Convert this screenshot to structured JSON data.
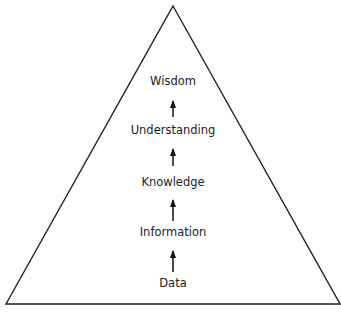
{
  "diagram": {
    "type": "pyramid",
    "shape": "triangle",
    "stroke_color": "#222222",
    "background": "#ffffff",
    "levels": [
      {
        "label": "Wisdom",
        "y": 81
      },
      {
        "label": "Understanding",
        "y": 130
      },
      {
        "label": "Knowledge",
        "y": 182
      },
      {
        "label": "Information",
        "y": 232
      },
      {
        "label": "Data",
        "y": 283
      }
    ],
    "arrows": [
      {
        "from": "Understanding",
        "to": "Wisdom",
        "direction": "up"
      },
      {
        "from": "Knowledge",
        "to": "Understanding",
        "direction": "up"
      },
      {
        "from": "Information",
        "to": "Knowledge",
        "direction": "up"
      },
      {
        "from": "Data",
        "to": "Information",
        "direction": "up"
      }
    ]
  }
}
